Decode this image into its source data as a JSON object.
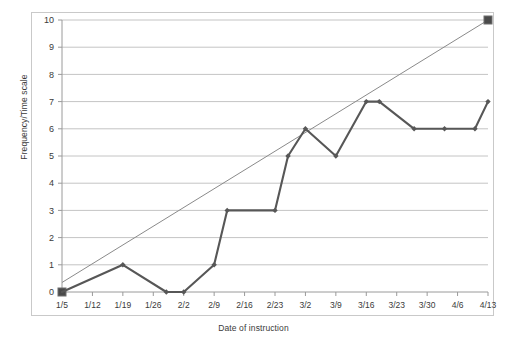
{
  "chart_data": {
    "type": "line",
    "title": "",
    "xlabel": "Date of instruction",
    "ylabel": "Frequency/Time scale",
    "categories": [
      "1/5",
      "1/12",
      "1/19",
      "1/26",
      "2/2",
      "2/9",
      "2/16",
      "2/23",
      "3/2",
      "3/9",
      "3/16",
      "3/23",
      "3/30",
      "4/6",
      "4/13"
    ],
    "ylim": [
      0,
      10
    ],
    "yticks": [
      0,
      1,
      2,
      3,
      4,
      5,
      6,
      7,
      8,
      9,
      10
    ],
    "grid": "horizontal",
    "legend": "none",
    "series": [
      {
        "name": "Frequency/Time scale",
        "marker": "diamond",
        "color": "#575757",
        "points": [
          {
            "x": "1/5",
            "y": 0
          },
          {
            "x": "1/19",
            "y": 1
          },
          {
            "x": "1/29",
            "y": 0
          },
          {
            "x": "2/2",
            "y": 0
          },
          {
            "x": "2/9",
            "y": 1
          },
          {
            "x": "2/12",
            "y": 3
          },
          {
            "x": "2/23",
            "y": 3
          },
          {
            "x": "2/26",
            "y": 5
          },
          {
            "x": "3/2",
            "y": 6
          },
          {
            "x": "3/9",
            "y": 5
          },
          {
            "x": "3/16",
            "y": 7
          },
          {
            "x": "3/19",
            "y": 7
          },
          {
            "x": "3/27",
            "y": 6
          },
          {
            "x": "4/3",
            "y": 6
          },
          {
            "x": "4/10",
            "y": 6
          },
          {
            "x": "4/13",
            "y": 7
          }
        ],
        "values": [
          0,
          0.5,
          1,
          0.5,
          0,
          1,
          3,
          3,
          6,
          5,
          7,
          7,
          6,
          6,
          7
        ]
      },
      {
        "name": "Trend line",
        "marker": "square",
        "color": "#8a8a8a",
        "endpoints": [
          {
            "x": "1/5",
            "y": 0.35
          },
          {
            "x": "4/13",
            "y": 10
          }
        ]
      }
    ],
    "colors": {
      "series_line": "#575757",
      "trend_line": "#8a8a8a",
      "marker_square": "#4a4a4a",
      "gridline": "#c4c4c4",
      "axis": "#9a9a9a",
      "frame": "#c9c9c9",
      "text": "#3a3a3a",
      "background": "#ffffff"
    }
  }
}
